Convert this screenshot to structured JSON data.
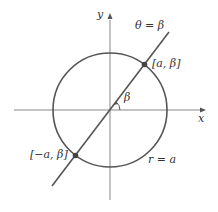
{
  "diagram": {
    "axes": {
      "x_label": "x",
      "y_label": "y"
    },
    "line_label": "θ = β",
    "angle_label": "β",
    "point_positive_label": "[a, β]",
    "point_negative_label": "[−a, β]",
    "circle_label": "r = a",
    "colors": {
      "curve": "#555555",
      "axis": "#777777",
      "point": "#444444"
    }
  }
}
